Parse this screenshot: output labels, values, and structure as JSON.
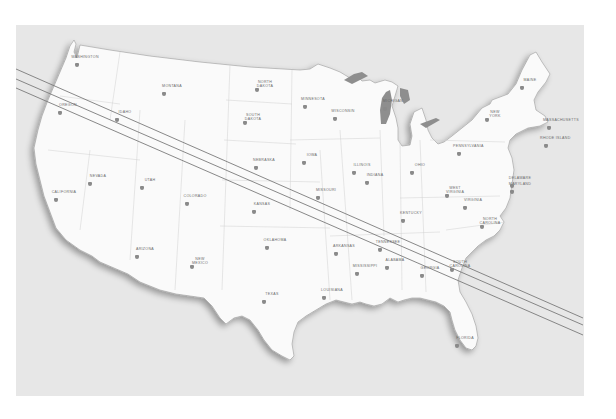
{
  "map": {
    "title": "Eclipse path across the contiguous United States",
    "colors": {
      "ocean": "#e4e4e4",
      "land": "#fafafa",
      "coast": "#9a9a9a",
      "lakes": "#8e8e8e",
      "path_line": "#7a7a7a",
      "marker": "#8a8a8a"
    },
    "path": {
      "lines": [
        {
          "name": "north-limit",
          "x1": 16,
          "y1": 69,
          "x2": 583,
          "y2": 318
        },
        {
          "name": "center-line",
          "x1": 16,
          "y1": 79,
          "x2": 583,
          "y2": 325
        },
        {
          "name": "south-limit",
          "x1": 16,
          "y1": 88,
          "x2": 583,
          "y2": 335
        }
      ]
    },
    "state_labels": [
      {
        "name": "WASHINGTON",
        "x": 85,
        "y": 57
      },
      {
        "name": "MONTANA",
        "x": 172,
        "y": 86
      },
      {
        "name": "OREGON",
        "x": 68,
        "y": 105
      },
      {
        "name": "IDAHO",
        "x": 125,
        "y": 112
      },
      {
        "name": "NORTH\nDAKOTA",
        "x": 265,
        "y": 82
      },
      {
        "name": "MINNESOTA",
        "x": 313,
        "y": 99
      },
      {
        "name": "SOUTH\nDAKOTA",
        "x": 253,
        "y": 115
      },
      {
        "name": "WISCONSIN",
        "x": 343,
        "y": 111
      },
      {
        "name": "MICHIGAN",
        "x": 393,
        "y": 101
      },
      {
        "name": "NEW\nYORK",
        "x": 495,
        "y": 112
      },
      {
        "name": "MAINE",
        "x": 530,
        "y": 80
      },
      {
        "name": "MASSACHUSETTS",
        "x": 557,
        "y": 120
      },
      {
        "name": "RHODE ISLAND",
        "x": 554,
        "y": 138
      },
      {
        "name": "PENNSYLVANIA",
        "x": 467,
        "y": 146
      },
      {
        "name": "NEBRASKA",
        "x": 264,
        "y": 160
      },
      {
        "name": "IOWA",
        "x": 312,
        "y": 155
      },
      {
        "name": "ILLINOIS",
        "x": 362,
        "y": 165
      },
      {
        "name": "INDIANA",
        "x": 375,
        "y": 175
      },
      {
        "name": "OHIO",
        "x": 420,
        "y": 165
      },
      {
        "name": "NEVADA",
        "x": 98,
        "y": 176
      },
      {
        "name": "UTAH",
        "x": 150,
        "y": 180
      },
      {
        "name": "CALIFORNIA",
        "x": 64,
        "y": 192
      },
      {
        "name": "COLORADO",
        "x": 195,
        "y": 196
      },
      {
        "name": "KANSAS",
        "x": 262,
        "y": 204
      },
      {
        "name": "MISSOURI",
        "x": 326,
        "y": 190
      },
      {
        "name": "KENTUCKY",
        "x": 411,
        "y": 213
      },
      {
        "name": "WEST\nVIRGINIA",
        "x": 455,
        "y": 188
      },
      {
        "name": "VIRGINIA",
        "x": 473,
        "y": 200
      },
      {
        "name": "DELAWARE",
        "x": 520,
        "y": 178
      },
      {
        "name": "MARYLAND",
        "x": 520,
        "y": 184
      },
      {
        "name": "NORTH\nCAROLINA",
        "x": 490,
        "y": 219
      },
      {
        "name": "TENNESSEE",
        "x": 388,
        "y": 242
      },
      {
        "name": "OKLAHOMA",
        "x": 275,
        "y": 240
      },
      {
        "name": "ARKANSAS",
        "x": 344,
        "y": 246
      },
      {
        "name": "NEW\nMEXICO",
        "x": 200,
        "y": 259
      },
      {
        "name": "ARIZONA",
        "x": 145,
        "y": 249
      },
      {
        "name": "ALABAMA",
        "x": 395,
        "y": 260
      },
      {
        "name": "MISSISSIPPI",
        "x": 365,
        "y": 266
      },
      {
        "name": "GEORGIA",
        "x": 430,
        "y": 268
      },
      {
        "name": "SOUTH\nCAROLINA",
        "x": 460,
        "y": 262
      },
      {
        "name": "TEXAS",
        "x": 272,
        "y": 294
      },
      {
        "name": "LOUISIANA",
        "x": 332,
        "y": 290
      },
      {
        "name": "FLORIDA",
        "x": 465,
        "y": 338
      }
    ]
  }
}
